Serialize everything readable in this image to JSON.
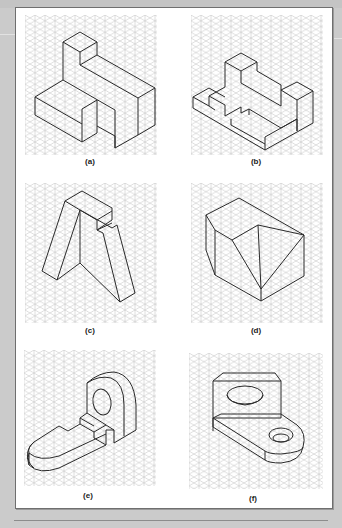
{
  "figure": {
    "type": "isometric-drawing-exercise",
    "panels": [
      {
        "id": "a",
        "label": "(a)",
        "description": "L-shaped stepped block with raised top cube"
      },
      {
        "id": "b",
        "label": "(b)",
        "description": "Stepped block with multiple notches and a recessed pocket"
      },
      {
        "id": "c",
        "label": "(c)",
        "description": "Inclined A-frame shaped block with stepped top"
      },
      {
        "id": "d",
        "label": "(d)",
        "description": "Block with chamfered corner and triangular cutout face"
      },
      {
        "id": "e",
        "label": "(e)",
        "description": "Bracket with rounded upright having a hole and rounded base tab with slot"
      },
      {
        "id": "f",
        "label": "(f)",
        "description": "Angle bracket with vertical plate hole and rounded base with hole"
      }
    ]
  },
  "colors": {
    "page_background": "#cbcbcb",
    "panel_background": "#ffffff",
    "panel_border": "#6f6f6f",
    "grid_line": "#c9c9c9",
    "object_line": "#2a2a2a"
  }
}
